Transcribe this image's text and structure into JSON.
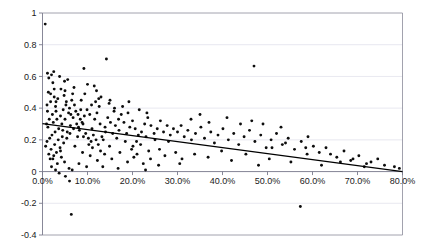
{
  "chart_data": {
    "type": "scatter",
    "title": "",
    "xlabel": "",
    "ylabel": "",
    "xlim": [
      0,
      80
    ],
    "ylim": [
      -0.4,
      1.0
    ],
    "grid": "horizontal",
    "legend": "none",
    "x_tick_labels": [
      "0.0%",
      "10.0%",
      "20.0%",
      "30.0%",
      "40.0%",
      "50.0%",
      "60.0%",
      "70.0%",
      "80.0%"
    ],
    "x_tick_values": [
      0,
      10,
      20,
      30,
      40,
      50,
      60,
      70,
      80
    ],
    "y_tick_labels": [
      "1",
      "0.8",
      "0.6",
      "0.4",
      "0.2",
      "0",
      "-0.2",
      "-0.4"
    ],
    "y_tick_values": [
      1,
      0.8,
      0.6,
      0.4,
      0.2,
      0,
      -0.2,
      -0.4
    ],
    "series": [
      {
        "name": "observations",
        "marker": "circle",
        "color": "#0d0d0d",
        "points": [
          [
            0.6,
            0.93
          ],
          [
            1.1,
            0.62
          ],
          [
            1.4,
            0.59
          ],
          [
            2.0,
            0.61
          ],
          [
            2.3,
            0.56
          ],
          [
            1.3,
            0.5
          ],
          [
            2.6,
            0.47
          ],
          [
            1.0,
            0.42
          ],
          [
            1.8,
            0.44
          ],
          [
            2.9,
            0.41
          ],
          [
            3.4,
            0.46
          ],
          [
            4.1,
            0.52
          ],
          [
            3.0,
            0.38
          ],
          [
            2.2,
            0.36
          ],
          [
            1.5,
            0.33
          ],
          [
            0.9,
            0.3
          ],
          [
            1.2,
            0.28
          ],
          [
            2.4,
            0.31
          ],
          [
            3.2,
            0.33
          ],
          [
            4.0,
            0.35
          ],
          [
            4.6,
            0.39
          ],
          [
            5.2,
            0.42
          ],
          [
            5.8,
            0.37
          ],
          [
            5.0,
            0.33
          ],
          [
            4.3,
            0.3
          ],
          [
            3.6,
            0.27
          ],
          [
            2.8,
            0.25
          ],
          [
            2.1,
            0.23
          ],
          [
            1.6,
            0.21
          ],
          [
            1.0,
            0.19
          ],
          [
            0.7,
            0.16
          ],
          [
            1.9,
            0.14
          ],
          [
            2.7,
            0.17
          ],
          [
            3.5,
            0.2
          ],
          [
            4.4,
            0.22
          ],
          [
            5.5,
            0.25
          ],
          [
            6.2,
            0.29
          ],
          [
            6.8,
            0.34
          ],
          [
            7.4,
            0.38
          ],
          [
            6.0,
            0.4
          ],
          [
            5.3,
            0.44
          ],
          [
            4.8,
            0.48
          ],
          [
            6.5,
            0.45
          ],
          [
            7.1,
            0.42
          ],
          [
            7.9,
            0.36
          ],
          [
            8.4,
            0.33
          ],
          [
            7.6,
            0.3
          ],
          [
            6.9,
            0.27
          ],
          [
            6.1,
            0.24
          ],
          [
            5.4,
            0.21
          ],
          [
            4.7,
            0.18
          ],
          [
            3.9,
            0.15
          ],
          [
            3.1,
            0.12
          ],
          [
            2.5,
            0.1
          ],
          [
            1.7,
            0.08
          ],
          [
            3.3,
            0.05
          ],
          [
            4.9,
            0.06
          ],
          [
            5.9,
            0.02
          ],
          [
            6.6,
            0.01
          ],
          [
            2.0,
            0.03
          ],
          [
            8.0,
            0.28
          ],
          [
            8.8,
            0.31
          ],
          [
            9.3,
            0.35
          ],
          [
            9.9,
            0.39
          ],
          [
            10.5,
            0.36
          ],
          [
            9.0,
            0.3
          ],
          [
            8.2,
            0.26
          ],
          [
            9.6,
            0.24
          ],
          [
            10.2,
            0.21
          ],
          [
            11.0,
            0.27
          ],
          [
            11.6,
            0.33
          ],
          [
            12.1,
            0.37
          ],
          [
            12.8,
            0.3
          ],
          [
            11.3,
            0.23
          ],
          [
            10.8,
            0.19
          ],
          [
            12.4,
            0.17
          ],
          [
            13.2,
            0.22
          ],
          [
            13.9,
            0.28
          ],
          [
            14.5,
            0.34
          ],
          [
            15.1,
            0.31
          ],
          [
            14.0,
            0.25
          ],
          [
            13.5,
            0.2
          ],
          [
            15.6,
            0.24
          ],
          [
            16.2,
            0.29
          ],
          [
            16.9,
            0.33
          ],
          [
            15.9,
            0.38
          ],
          [
            14.8,
            0.43
          ],
          [
            13.0,
            0.47
          ],
          [
            12.0,
            0.51
          ],
          [
            10.0,
            0.55
          ],
          [
            9.4,
            0.49
          ],
          [
            8.6,
            0.45
          ],
          [
            11.8,
            0.44
          ],
          [
            12.6,
            0.41
          ],
          [
            16.0,
            0.4
          ],
          [
            17.5,
            0.36
          ],
          [
            18.1,
            0.31
          ],
          [
            17.0,
            0.26
          ],
          [
            16.5,
            0.21
          ],
          [
            18.7,
            0.24
          ],
          [
            19.4,
            0.28
          ],
          [
            20.0,
            0.32
          ],
          [
            19.0,
            0.37
          ],
          [
            20.6,
            0.27
          ],
          [
            21.3,
            0.23
          ],
          [
            20.9,
            0.19
          ],
          [
            22.0,
            0.25
          ],
          [
            22.7,
            0.3
          ],
          [
            23.4,
            0.34
          ],
          [
            24.1,
            0.29
          ],
          [
            23.0,
            0.22
          ],
          [
            21.8,
            0.17
          ],
          [
            24.8,
            0.24
          ],
          [
            25.5,
            0.27
          ],
          [
            26.2,
            0.32
          ],
          [
            25.0,
            0.2
          ],
          [
            26.9,
            0.25
          ],
          [
            27.7,
            0.29
          ],
          [
            28.4,
            0.23
          ],
          [
            29.1,
            0.27
          ],
          [
            28.0,
            0.19
          ],
          [
            30.0,
            0.25
          ],
          [
            30.8,
            0.29
          ],
          [
            31.5,
            0.22
          ],
          [
            32.3,
            0.26
          ],
          [
            33.1,
            0.2
          ],
          [
            34.0,
            0.24
          ],
          [
            35.2,
            0.28
          ],
          [
            36.0,
            0.21
          ],
          [
            37.4,
            0.25
          ],
          [
            38.2,
            0.18
          ],
          [
            39.0,
            0.23
          ],
          [
            40.1,
            0.27
          ],
          [
            41.3,
            0.2
          ],
          [
            42.5,
            0.24
          ],
          [
            43.6,
            0.17
          ],
          [
            44.8,
            0.22
          ],
          [
            46.0,
            0.26
          ],
          [
            47.2,
            0.19
          ],
          [
            48.5,
            0.23
          ],
          [
            49.7,
            0.15
          ],
          [
            50.8,
            0.2
          ],
          [
            52.0,
            0.24
          ],
          [
            53.3,
            0.17
          ],
          [
            54.6,
            0.21
          ],
          [
            56.0,
            0.14
          ],
          [
            57.5,
            0.19
          ],
          [
            58.8,
            0.11
          ],
          [
            60.2,
            0.16
          ],
          [
            61.5,
            0.12
          ],
          [
            63.0,
            0.15
          ],
          [
            65.4,
            0.09
          ],
          [
            67.0,
            0.13
          ],
          [
            68.5,
            0.07
          ],
          [
            70.3,
            0.1
          ],
          [
            72.0,
            0.05
          ],
          [
            74.5,
            0.08
          ],
          [
            76.0,
            0.04
          ],
          [
            78.2,
            0.03
          ],
          [
            79.3,
            0.02
          ],
          [
            9.2,
            0.65
          ],
          [
            14.2,
            0.71
          ],
          [
            11.5,
            0.54
          ],
          [
            47.0,
            0.665
          ],
          [
            5.6,
            0.58
          ],
          [
            3.8,
            0.6
          ],
          [
            2.5,
            0.63
          ],
          [
            1.1,
            0.38
          ],
          [
            6.3,
            0.36
          ],
          [
            7.8,
            0.22
          ],
          [
            4.2,
            0.09
          ],
          [
            5.1,
            -0.03
          ],
          [
            6.0,
            -0.06
          ],
          [
            6.4,
            -0.27
          ],
          [
            57.3,
            -0.22
          ],
          [
            8.9,
            0.12
          ],
          [
            10.6,
            0.1
          ],
          [
            12.2,
            0.07
          ],
          [
            13.8,
            0.11
          ],
          [
            15.4,
            0.08
          ],
          [
            17.2,
            0.12
          ],
          [
            18.9,
            0.06
          ],
          [
            20.3,
            0.09
          ],
          [
            22.4,
            0.05
          ],
          [
            24.0,
            0.08
          ],
          [
            3.0,
            0.44
          ],
          [
            4.5,
            0.26
          ],
          [
            7.2,
            0.16
          ],
          [
            8.1,
            0.05
          ],
          [
            9.8,
            0.03
          ],
          [
            11.1,
            0.15
          ],
          [
            12.9,
            0.13
          ],
          [
            19.8,
            0.14
          ],
          [
            21.0,
            0.11
          ],
          [
            23.6,
            0.13
          ],
          [
            2.3,
            0.08
          ],
          [
            1.4,
            0.11
          ],
          [
            2.9,
            0.01
          ],
          [
            3.7,
            -0.01
          ],
          [
            4.0,
            0.13
          ],
          [
            26.0,
            0.14
          ],
          [
            27.2,
            0.1
          ],
          [
            29.6,
            0.12
          ],
          [
            31.0,
            0.08
          ],
          [
            33.8,
            0.11
          ],
          [
            36.8,
            0.09
          ],
          [
            39.8,
            0.13
          ],
          [
            42.0,
            0.07
          ],
          [
            45.2,
            0.11
          ],
          [
            48.0,
            0.04
          ],
          [
            50.4,
            0.08
          ],
          [
            53.0,
            0.28
          ],
          [
            55.2,
            0.06
          ],
          [
            59.0,
            0.22
          ],
          [
            62.0,
            0.04
          ],
          [
            13.4,
            0.03
          ],
          [
            16.8,
            0.02
          ],
          [
            22.9,
            0.01
          ],
          [
            25.8,
            0.04
          ],
          [
            30.5,
            0.05
          ],
          [
            5.0,
            0.51
          ],
          [
            6.7,
            0.49
          ],
          [
            8.5,
            0.39
          ],
          [
            10.9,
            0.42
          ],
          [
            12.5,
            0.46
          ],
          [
            15.0,
            0.45
          ],
          [
            17.8,
            0.41
          ],
          [
            19.2,
            0.44
          ],
          [
            21.5,
            0.39
          ],
          [
            23.2,
            0.37
          ],
          [
            33.0,
            0.33
          ],
          [
            35.0,
            0.36
          ],
          [
            37.0,
            0.31
          ],
          [
            41.0,
            0.34
          ],
          [
            44.0,
            0.3
          ],
          [
            46.5,
            0.32
          ],
          [
            49.0,
            0.3
          ],
          [
            51.0,
            0.15
          ],
          [
            54.0,
            0.18
          ],
          [
            58.5,
            0.15
          ],
          [
            64.0,
            0.11
          ],
          [
            66.2,
            0.06
          ],
          [
            69.0,
            0.08
          ],
          [
            71.5,
            0.03
          ],
          [
            73.0,
            0.06
          ],
          [
            4.9,
            0.57
          ],
          [
            7.0,
            0.53
          ],
          [
            2.6,
            0.52
          ],
          [
            1.8,
            0.49
          ],
          [
            9.1,
            0.22
          ],
          [
            10.3,
            0.17
          ],
          [
            11.9,
            0.2
          ],
          [
            14.9,
            0.16
          ],
          [
            18.4,
            0.19
          ],
          [
            20.1,
            0.16
          ]
        ]
      }
    ],
    "trendline": {
      "type": "linear",
      "x_start": 0,
      "y_start": 0.302,
      "x_end": 80,
      "y_end": 0.0,
      "color": "#000000"
    }
  }
}
